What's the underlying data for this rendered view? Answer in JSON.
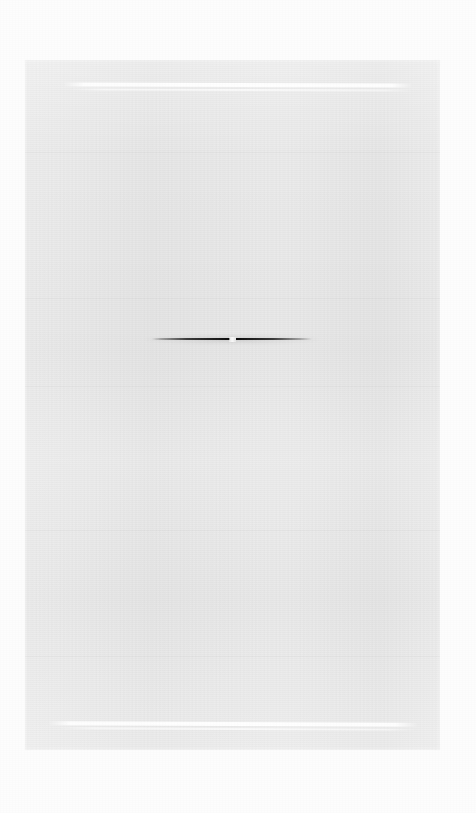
{
  "document": {
    "title": "",
    "body_text": "",
    "description": "Blank faded document page with two faint white horizontal rules and one dark horizontal mark at center"
  },
  "canvas": {
    "background_color": "#fdfdfd",
    "width": 476,
    "height": 813
  },
  "page_panel": {
    "fill_color": "#e7e7e7",
    "left": 25,
    "top": 60,
    "width": 415,
    "height": 690,
    "label": ""
  },
  "rules": [
    {
      "name": "top-rule",
      "color": "#ffffff",
      "left": 63,
      "top": 83,
      "width": 350,
      "label": ""
    },
    {
      "name": "bottom-rule",
      "color": "#ffffff",
      "left": 48,
      "top": 722,
      "width": 370,
      "label": ""
    }
  ],
  "center_mark": {
    "name": "dark-horizontal-mark",
    "color": "#050505",
    "left": 152,
    "top": 336,
    "width": 160,
    "height": 3,
    "notch_color": "#fcfcfc",
    "label": ""
  }
}
